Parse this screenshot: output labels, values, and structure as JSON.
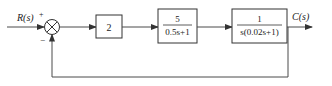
{
  "diagram": {
    "type": "control-system-block-diagram",
    "input": {
      "label": "R(s)"
    },
    "output": {
      "label": "C(s)"
    },
    "summing_junction": {
      "plus_sign": "+",
      "minus_sign": "−"
    },
    "blocks": [
      {
        "id": "gain",
        "expr": "2"
      },
      {
        "id": "first-order",
        "numerator": "5",
        "denominator": "0.5s+1"
      },
      {
        "id": "plant",
        "numerator": "1",
        "denominator": "s(0.02s+1)"
      }
    ],
    "feedback": {
      "type": "unity",
      "sign": "negative"
    },
    "colors": {
      "line": "#4a4a4a",
      "text": "#222222",
      "background": "#ffffff"
    }
  }
}
